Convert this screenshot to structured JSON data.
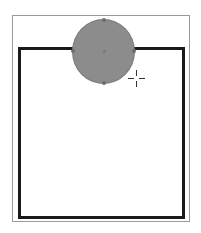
{
  "canvas": {
    "background": "#ffffff"
  },
  "page_frame": {
    "border_color": "#9a9a9a"
  },
  "shapes": [
    {
      "type": "rectangle",
      "stroke": "#1a1a1a",
      "fill": "#ffffff",
      "stroke_width": 3
    },
    {
      "type": "ellipse",
      "fill": "#8c8c8c",
      "stroke": "#7a7a7a",
      "selected": true
    }
  ],
  "cursor": {
    "type": "crosshair-icon"
  }
}
